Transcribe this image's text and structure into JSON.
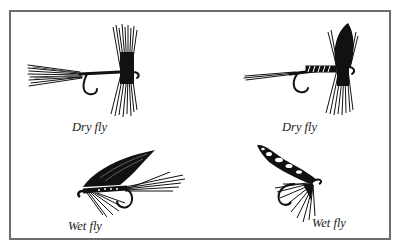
{
  "figure": {
    "border_color": "#6e6e6e",
    "ink_color": "#111111",
    "items": [
      {
        "id": "dry-fly-1",
        "label": "Dry fly",
        "type": "dry"
      },
      {
        "id": "dry-fly-2",
        "label": "Dry fly",
        "type": "dry"
      },
      {
        "id": "wet-fly-1",
        "label": "Wet fly",
        "type": "wet"
      },
      {
        "id": "wet-fly-2",
        "label": "Wet fly",
        "type": "wet"
      }
    ]
  }
}
